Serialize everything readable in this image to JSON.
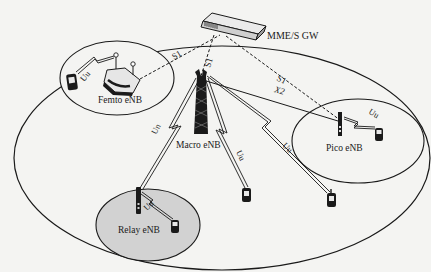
{
  "diagram": {
    "type": "LTE-Advanced heterogeneous network architecture",
    "colors": {
      "background": "#f4f4f2",
      "line": "#1a1a1a",
      "relay_cell_fill": "#d2d2d2"
    },
    "nodes": {
      "gateway": {
        "label": "MME/S GW"
      },
      "macro": {
        "label": "Macro eNB"
      },
      "femto": {
        "label": "Femto eNB"
      },
      "pico": {
        "label": "Pico eNB"
      },
      "relay": {
        "label": "Relay eNB"
      }
    },
    "links": {
      "s1_femto": "S1",
      "s1_macro": "S1",
      "s1_pico": "S1",
      "x2_macro_pico": "X2",
      "un_macro_relay": "Un",
      "uu_macro_ue1": "Uu",
      "uu_macro_ue2": "Uu",
      "uu_femto": "Uu",
      "uu_pico": "Uu",
      "uu_relay": "Uu"
    }
  }
}
